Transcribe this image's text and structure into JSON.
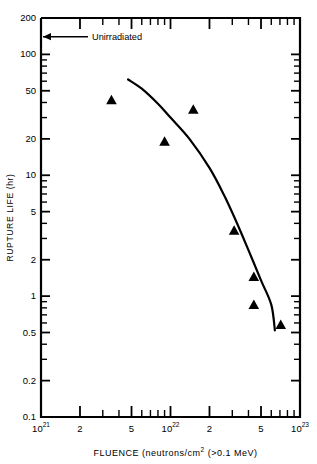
{
  "chart_data": {
    "type": "scatter",
    "title": "",
    "subtitle": "",
    "xlabel": "FLUENCE (neutrons/cm2 (>0.1 MeV)",
    "xlabel_parts": {
      "prefix": "FLUENCE (neutrons/cm",
      "exponent": "2",
      "suffix": " (>0.1 MeV)"
    },
    "ylabel": "RUPTURE LIFE (hr)",
    "xscale": "log",
    "yscale": "log",
    "xlim": [
      1e+21,
      1e+23
    ],
    "ylim": [
      0.1,
      200
    ],
    "grid": false,
    "legend": null,
    "xticks": [
      {
        "value": 1e+21,
        "label": "10",
        "exponent": "21",
        "major": true
      },
      {
        "value": 2e+21,
        "label": "2",
        "exponent": "",
        "major": true
      },
      {
        "value": 3e+21,
        "label": "",
        "exponent": "",
        "major": false
      },
      {
        "value": 4e+21,
        "label": "",
        "exponent": "",
        "major": false
      },
      {
        "value": 5e+21,
        "label": "5",
        "exponent": "",
        "major": true
      },
      {
        "value": 6e+21,
        "label": "",
        "exponent": "",
        "major": false
      },
      {
        "value": 7e+21,
        "label": "",
        "exponent": "",
        "major": false
      },
      {
        "value": 8e+21,
        "label": "",
        "exponent": "",
        "major": false
      },
      {
        "value": 9e+21,
        "label": "",
        "exponent": "",
        "major": false
      },
      {
        "value": 1e+22,
        "label": "10",
        "exponent": "22",
        "major": true
      },
      {
        "value": 2e+22,
        "label": "2",
        "exponent": "",
        "major": true
      },
      {
        "value": 3e+22,
        "label": "",
        "exponent": "",
        "major": false
      },
      {
        "value": 4e+22,
        "label": "",
        "exponent": "",
        "major": false
      },
      {
        "value": 5e+22,
        "label": "5",
        "exponent": "",
        "major": true
      },
      {
        "value": 6e+22,
        "label": "",
        "exponent": "",
        "major": false
      },
      {
        "value": 7e+22,
        "label": "",
        "exponent": "",
        "major": false
      },
      {
        "value": 8e+22,
        "label": "",
        "exponent": "",
        "major": false
      },
      {
        "value": 9e+22,
        "label": "",
        "exponent": "",
        "major": false
      },
      {
        "value": 1e+23,
        "label": "10",
        "exponent": "23",
        "major": true
      }
    ],
    "yticks": [
      {
        "value": 200,
        "label": "200",
        "major": true
      },
      {
        "value": 100,
        "label": "100",
        "major": true
      },
      {
        "value": 90,
        "label": "",
        "major": false
      },
      {
        "value": 80,
        "label": "",
        "major": false
      },
      {
        "value": 70,
        "label": "",
        "major": false
      },
      {
        "value": 60,
        "label": "",
        "major": false
      },
      {
        "value": 50,
        "label": "50",
        "major": true
      },
      {
        "value": 40,
        "label": "",
        "major": false
      },
      {
        "value": 30,
        "label": "",
        "major": false
      },
      {
        "value": 20,
        "label": "20",
        "major": true
      },
      {
        "value": 10,
        "label": "10",
        "major": true
      },
      {
        "value": 9,
        "label": "",
        "major": false
      },
      {
        "value": 8,
        "label": "",
        "major": false
      },
      {
        "value": 7,
        "label": "",
        "major": false
      },
      {
        "value": 6,
        "label": "",
        "major": false
      },
      {
        "value": 5,
        "label": "5",
        "major": true
      },
      {
        "value": 4,
        "label": "",
        "major": false
      },
      {
        "value": 3,
        "label": "",
        "major": false
      },
      {
        "value": 2,
        "label": "2",
        "major": true
      },
      {
        "value": 1,
        "label": "1",
        "major": true
      },
      {
        "value": 0.9,
        "label": "",
        "major": false
      },
      {
        "value": 0.8,
        "label": "",
        "major": false
      },
      {
        "value": 0.7,
        "label": "",
        "major": false
      },
      {
        "value": 0.6,
        "label": "",
        "major": false
      },
      {
        "value": 0.5,
        "label": "0.5",
        "major": true
      },
      {
        "value": 0.4,
        "label": "",
        "major": false
      },
      {
        "value": 0.3,
        "label": "",
        "major": false
      },
      {
        "value": 0.2,
        "label": "0.2",
        "major": true
      },
      {
        "value": 0.1,
        "label": "0.1",
        "major": true
      }
    ],
    "series": [
      {
        "name": "data-points",
        "marker": "triangle-up",
        "color": "#000000",
        "points": [
          {
            "x": 3.5e+21,
            "y": 42
          },
          {
            "x": 9e+21,
            "y": 19
          },
          {
            "x": 1.5e+22,
            "y": 35
          },
          {
            "x": 3.1e+22,
            "y": 3.5
          },
          {
            "x": 4.4e+22,
            "y": 1.45
          },
          {
            "x": 4.4e+22,
            "y": 0.85
          },
          {
            "x": 7.1e+22,
            "y": 0.58
          }
        ]
      },
      {
        "name": "fitted-curve",
        "marker": "none",
        "color": "#000000",
        "points": [
          {
            "x": 4.7e+21,
            "y": 62
          },
          {
            "x": 6e+21,
            "y": 52
          },
          {
            "x": 8e+21,
            "y": 39
          },
          {
            "x": 1e+22,
            "y": 30
          },
          {
            "x": 1.4e+22,
            "y": 20
          },
          {
            "x": 2e+22,
            "y": 11.5
          },
          {
            "x": 2.6e+22,
            "y": 6.8
          },
          {
            "x": 3.2e+22,
            "y": 4.2
          },
          {
            "x": 4e+22,
            "y": 2.4
          },
          {
            "x": 5e+22,
            "y": 1.35
          },
          {
            "x": 6e+22,
            "y": 0.85
          },
          {
            "x": 6.4e+22,
            "y": 0.52
          }
        ]
      }
    ],
    "annotations": [
      {
        "name": "unirradiated-arrow",
        "text": "Unirradiated",
        "y_value": 140,
        "arrow_direction": "left"
      }
    ]
  }
}
